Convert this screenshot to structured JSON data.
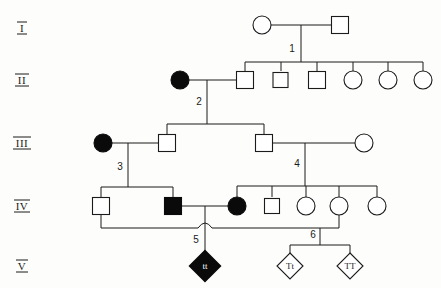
{
  "figure": {
    "type": "pedigree-chart",
    "title": "",
    "width": 441,
    "height": 288,
    "background_color": "#fdfdfb",
    "line_color": "#1b1b1b",
    "affected_fill_color": "#0a0a0a",
    "unaffected_fill_color": "#ffffff"
  },
  "generations": [
    {
      "id": "I",
      "label": "I",
      "y": 28
    },
    {
      "id": "II",
      "label": "II",
      "y": 80
    },
    {
      "id": "III",
      "label": "III",
      "y": 143
    },
    {
      "id": "IV",
      "label": "IV",
      "y": 206
    },
    {
      "id": "V",
      "label": "V",
      "y": 266
    }
  ],
  "sibship_labels": [
    {
      "id": "s1",
      "label": "1",
      "x": 292,
      "y": 49
    },
    {
      "id": "s2",
      "label": "2",
      "x": 207,
      "y": 101
    },
    {
      "id": "s3",
      "label": "3",
      "x": 128,
      "y": 166
    },
    {
      "id": "s4",
      "label": "4",
      "x": 305,
      "y": 163
    },
    {
      "id": "s5",
      "label": "5",
      "x": 196,
      "y": 240
    },
    {
      "id": "s6",
      "label": "6",
      "x": 314,
      "y": 233
    }
  ],
  "individuals": [
    {
      "id": "I-1",
      "gen": "I",
      "sex": "female",
      "shape": "circle",
      "affected": false,
      "x": 262,
      "y": 25,
      "genotype": ""
    },
    {
      "id": "I-2",
      "gen": "I",
      "sex": "male",
      "shape": "square",
      "affected": false,
      "x": 340,
      "y": 25,
      "genotype": ""
    },
    {
      "id": "II-1",
      "gen": "II",
      "sex": "female",
      "shape": "circle",
      "affected": true,
      "x": 180,
      "y": 80,
      "genotype": ""
    },
    {
      "id": "II-2",
      "gen": "II",
      "sex": "male",
      "shape": "square",
      "affected": false,
      "x": 245,
      "y": 80,
      "genotype": ""
    },
    {
      "id": "II-3",
      "gen": "II",
      "sex": "male",
      "shape": "square",
      "affected": false,
      "x": 281,
      "y": 80,
      "genotype": ""
    },
    {
      "id": "II-4",
      "gen": "II",
      "sex": "male",
      "shape": "square",
      "affected": false,
      "x": 317,
      "y": 80,
      "genotype": ""
    },
    {
      "id": "II-5",
      "gen": "II",
      "sex": "female",
      "shape": "circle",
      "affected": false,
      "x": 353,
      "y": 80,
      "genotype": ""
    },
    {
      "id": "II-6",
      "gen": "II",
      "sex": "female",
      "shape": "circle",
      "affected": false,
      "x": 388,
      "y": 80,
      "genotype": ""
    },
    {
      "id": "II-7",
      "gen": "II",
      "sex": "female",
      "shape": "circle",
      "affected": false,
      "x": 423,
      "y": 80,
      "genotype": ""
    },
    {
      "id": "III-1",
      "gen": "III",
      "sex": "female",
      "shape": "circle",
      "affected": true,
      "x": 103,
      "y": 143,
      "genotype": ""
    },
    {
      "id": "III-2",
      "gen": "III",
      "sex": "male",
      "shape": "square",
      "affected": false,
      "x": 167,
      "y": 143,
      "genotype": ""
    },
    {
      "id": "III-3",
      "gen": "III",
      "sex": "male",
      "shape": "square",
      "affected": false,
      "x": 264,
      "y": 143,
      "genotype": ""
    },
    {
      "id": "III-4",
      "gen": "III",
      "sex": "female",
      "shape": "circle",
      "affected": false,
      "x": 364,
      "y": 143,
      "genotype": ""
    },
    {
      "id": "IV-1",
      "gen": "IV",
      "sex": "male",
      "shape": "square",
      "affected": false,
      "x": 101,
      "y": 206,
      "genotype": ""
    },
    {
      "id": "IV-2",
      "gen": "IV",
      "sex": "male",
      "shape": "square",
      "affected": true,
      "x": 173,
      "y": 206,
      "genotype": ""
    },
    {
      "id": "IV-3",
      "gen": "IV",
      "sex": "female",
      "shape": "circle",
      "affected": true,
      "x": 237,
      "y": 206,
      "genotype": ""
    },
    {
      "id": "IV-4",
      "gen": "IV",
      "sex": "male",
      "shape": "square",
      "affected": false,
      "x": 272,
      "y": 206,
      "genotype": ""
    },
    {
      "id": "IV-5",
      "gen": "IV",
      "sex": "female",
      "shape": "circle",
      "affected": false,
      "x": 306,
      "y": 206,
      "genotype": ""
    },
    {
      "id": "IV-6",
      "gen": "IV",
      "sex": "female",
      "shape": "circle",
      "affected": false,
      "x": 339,
      "y": 206,
      "genotype": ""
    },
    {
      "id": "IV-7",
      "gen": "IV",
      "sex": "female",
      "shape": "circle",
      "affected": false,
      "x": 377,
      "y": 206,
      "genotype": ""
    },
    {
      "id": "V-1",
      "gen": "V",
      "sex": "unknown",
      "shape": "diamond",
      "affected": true,
      "bold": true,
      "x": 203,
      "y": 266,
      "genotype": "tt"
    },
    {
      "id": "V-2",
      "gen": "V",
      "sex": "unknown",
      "shape": "diamond",
      "affected": false,
      "bold": false,
      "x": 290,
      "y": 266,
      "genotype": "Tt"
    },
    {
      "id": "V-3",
      "gen": "V",
      "sex": "unknown",
      "shape": "diamond",
      "affected": false,
      "bold": false,
      "x": 350,
      "y": 266,
      "genotype": "TT"
    }
  ],
  "symbol_sizes": {
    "square_side": 17,
    "circle_radius": 9,
    "diamond_half": 13
  }
}
